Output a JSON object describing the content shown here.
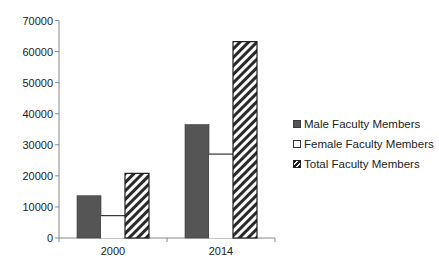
{
  "chart_data": {
    "type": "bar",
    "title": "",
    "xlabel": "",
    "ylabel": "",
    "categories": [
      "2000",
      "2014"
    ],
    "series": [
      {
        "name": "Male Faculty Members",
        "values": [
          13600,
          36500
        ],
        "style": "solid",
        "color": "#555555"
      },
      {
        "name": "Female Faculty Members",
        "values": [
          7200,
          27000
        ],
        "style": "hollow",
        "color": "#ffffff"
      },
      {
        "name": "Total Faculty Members",
        "values": [
          20800,
          63200
        ],
        "style": "hatched",
        "color": "#333333"
      }
    ],
    "ylim": [
      0,
      70000
    ],
    "yticks": [
      "0",
      "10000",
      "20000",
      "30000",
      "40000",
      "50000",
      "60000",
      "70000"
    ],
    "grid": false,
    "legend_position": "right"
  },
  "legend": {
    "items": [
      {
        "label": "Male Faculty Members"
      },
      {
        "label": "Female Faculty Members"
      },
      {
        "label": "Total Faculty Members"
      }
    ]
  }
}
